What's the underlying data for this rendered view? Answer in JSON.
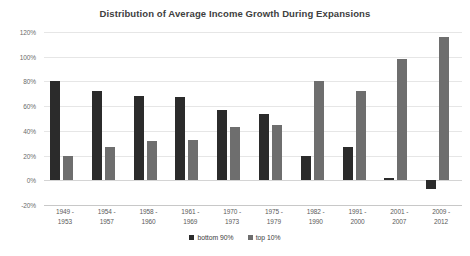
{
  "chart_data": {
    "type": "bar",
    "title": "Distribution of Average Income Growth During Expansions",
    "xlabel": "",
    "ylabel": "",
    "categories": [
      "1949 - 1953",
      "1954 - 1957",
      "1958 - 1960",
      "1961 - 1969",
      "1970 - 1973",
      "1975 - 1979",
      "1982 - 1990",
      "1991 - 2000",
      "2001 - 2007",
      "2009 - 2012"
    ],
    "category_lines": [
      [
        "1949 -",
        "1953"
      ],
      [
        "1954 -",
        "1957"
      ],
      [
        "1958 -",
        "1960"
      ],
      [
        "1961 -",
        "1969"
      ],
      [
        "1970 -",
        "1973"
      ],
      [
        "1975 -",
        "1979"
      ],
      [
        "1982 -",
        "1990"
      ],
      [
        "1991 -",
        "2000"
      ],
      [
        "2001 -",
        "2007"
      ],
      [
        "2009 -",
        "2012"
      ]
    ],
    "series": [
      {
        "name": "bottom 90%",
        "color": "#2b2b2b",
        "values": [
          80,
          72,
          68,
          67,
          57,
          54,
          20,
          27,
          2,
          -7
        ]
      },
      {
        "name": "top 10%",
        "color": "#6e6e6e",
        "values": [
          20,
          27,
          32,
          33,
          43,
          45,
          80,
          72,
          98,
          116
        ]
      }
    ],
    "ylim": [
      -20,
      120
    ],
    "ytick_step": 20,
    "ytick_labels": [
      "120%",
      "100%",
      "80%",
      "60%",
      "40%",
      "20%",
      "0%",
      "-20%"
    ],
    "ytick_values": [
      120,
      100,
      80,
      60,
      40,
      20,
      0,
      -20
    ],
    "grid": true,
    "legend_position": "bottom-right"
  }
}
